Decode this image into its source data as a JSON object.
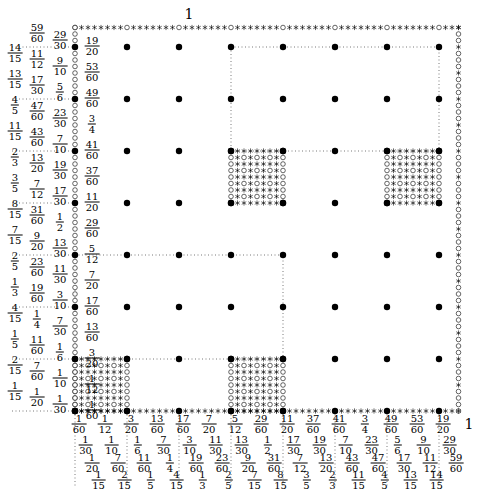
{
  "diagram": {
    "grid": {
      "denominator": 60,
      "filled_positions": [
        1,
        9,
        17,
        25,
        33,
        41,
        49,
        57
      ]
    },
    "corner_label": "1",
    "right_bottom_label": "1",
    "x_labels": [
      {
        "pos": 1,
        "text": "1/60",
        "row": 0
      },
      {
        "pos": 5,
        "text": "1/12",
        "row": 0
      },
      {
        "pos": 9,
        "text": "3/20",
        "row": 0
      },
      {
        "pos": 13,
        "text": "13/60",
        "row": 0
      },
      {
        "pos": 17,
        "text": "17/60",
        "row": 0
      },
      {
        "pos": 21,
        "text": "7/20",
        "row": 0
      },
      {
        "pos": 25,
        "text": "5/12",
        "row": 0
      },
      {
        "pos": 29,
        "text": "29/60",
        "row": 0
      },
      {
        "pos": 33,
        "text": "11/20",
        "row": 0
      },
      {
        "pos": 37,
        "text": "37/60",
        "row": 0
      },
      {
        "pos": 41,
        "text": "41/60",
        "row": 0
      },
      {
        "pos": 45,
        "text": "3/4",
        "row": 0
      },
      {
        "pos": 49,
        "text": "49/60",
        "row": 0
      },
      {
        "pos": 53,
        "text": "53/60",
        "row": 0
      },
      {
        "pos": 57,
        "text": "19/20",
        "row": 0
      },
      {
        "pos": 2,
        "text": "1/30",
        "row": 1
      },
      {
        "pos": 6,
        "text": "1/10",
        "row": 1
      },
      {
        "pos": 10,
        "text": "1/6",
        "row": 1
      },
      {
        "pos": 14,
        "text": "7/30",
        "row": 1
      },
      {
        "pos": 18,
        "text": "3/10",
        "row": 1
      },
      {
        "pos": 22,
        "text": "11/30",
        "row": 1
      },
      {
        "pos": 26,
        "text": "13/30",
        "row": 1
      },
      {
        "pos": 30,
        "text": "1/2",
        "row": 1
      },
      {
        "pos": 34,
        "text": "17/30",
        "row": 1
      },
      {
        "pos": 38,
        "text": "19/30",
        "row": 1
      },
      {
        "pos": 42,
        "text": "7/10",
        "row": 1
      },
      {
        "pos": 46,
        "text": "23/30",
        "row": 1
      },
      {
        "pos": 50,
        "text": "5/6",
        "row": 1
      },
      {
        "pos": 54,
        "text": "9/10",
        "row": 1
      },
      {
        "pos": 58,
        "text": "29/30",
        "row": 1
      },
      {
        "pos": 3,
        "text": "1/20",
        "row": 2
      },
      {
        "pos": 7,
        "text": "7/60",
        "row": 2
      },
      {
        "pos": 11,
        "text": "11/60",
        "row": 2
      },
      {
        "pos": 15,
        "text": "1/4",
        "row": 2
      },
      {
        "pos": 19,
        "text": "19/60",
        "row": 2
      },
      {
        "pos": 23,
        "text": "23/60",
        "row": 2
      },
      {
        "pos": 27,
        "text": "9/20",
        "row": 2
      },
      {
        "pos": 31,
        "text": "31/60",
        "row": 2
      },
      {
        "pos": 35,
        "text": "7/12",
        "row": 2
      },
      {
        "pos": 39,
        "text": "13/20",
        "row": 2
      },
      {
        "pos": 43,
        "text": "43/60",
        "row": 2
      },
      {
        "pos": 47,
        "text": "47/60",
        "row": 2
      },
      {
        "pos": 51,
        "text": "17/30",
        "row": 2
      },
      {
        "pos": 55,
        "text": "11/12",
        "row": 2
      },
      {
        "pos": 59,
        "text": "59/60",
        "row": 2
      },
      {
        "pos": 4,
        "text": "1/15",
        "row": 3
      },
      {
        "pos": 8,
        "text": "2/15",
        "row": 3
      },
      {
        "pos": 12,
        "text": "1/5",
        "row": 3
      },
      {
        "pos": 16,
        "text": "4/15",
        "row": 3
      },
      {
        "pos": 20,
        "text": "1/3",
        "row": 3
      },
      {
        "pos": 24,
        "text": "2/5",
        "row": 3
      },
      {
        "pos": 28,
        "text": "7/15",
        "row": 3
      },
      {
        "pos": 32,
        "text": "8/15",
        "row": 3
      },
      {
        "pos": 36,
        "text": "3/5",
        "row": 3
      },
      {
        "pos": 40,
        "text": "2/3",
        "row": 3
      },
      {
        "pos": 44,
        "text": "11/15",
        "row": 3
      },
      {
        "pos": 48,
        "text": "4/5",
        "row": 3
      },
      {
        "pos": 52,
        "text": "13/15",
        "row": 3
      },
      {
        "pos": 56,
        "text": "14/15",
        "row": 3
      }
    ],
    "y_labels": [
      {
        "pos": 57,
        "text": "19/20",
        "col": 0
      },
      {
        "pos": 53,
        "text": "53/60",
        "col": 0
      },
      {
        "pos": 49,
        "text": "49/60",
        "col": 0
      },
      {
        "pos": 45,
        "text": "3/4",
        "col": 0
      },
      {
        "pos": 41,
        "text": "41/60",
        "col": 0
      },
      {
        "pos": 37,
        "text": "37/60",
        "col": 0
      },
      {
        "pos": 33,
        "text": "11/20",
        "col": 0
      },
      {
        "pos": 29,
        "text": "29/60",
        "col": 0
      },
      {
        "pos": 25,
        "text": "5/12",
        "col": 0
      },
      {
        "pos": 21,
        "text": "7/20",
        "col": 0
      },
      {
        "pos": 17,
        "text": "17/60",
        "col": 0
      },
      {
        "pos": 13,
        "text": "13/60",
        "col": 0
      },
      {
        "pos": 9,
        "text": "3/20",
        "col": 0
      },
      {
        "pos": 5,
        "text": "1/12",
        "col": 0
      },
      {
        "pos": 1,
        "text": "1/60",
        "col": 0
      },
      {
        "pos": 58,
        "text": "29/30",
        "col": 1
      },
      {
        "pos": 54,
        "text": "9/10",
        "col": 1
      },
      {
        "pos": 50,
        "text": "5/6",
        "col": 1
      },
      {
        "pos": 46,
        "text": "23/30",
        "col": 1
      },
      {
        "pos": 42,
        "text": "7/10",
        "col": 1
      },
      {
        "pos": 38,
        "text": "19/30",
        "col": 1
      },
      {
        "pos": 34,
        "text": "17/30",
        "col": 1
      },
      {
        "pos": 30,
        "text": "1/2",
        "col": 1
      },
      {
        "pos": 26,
        "text": "13/30",
        "col": 1
      },
      {
        "pos": 22,
        "text": "11/30",
        "col": 1
      },
      {
        "pos": 18,
        "text": "3/10",
        "col": 1
      },
      {
        "pos": 14,
        "text": "7/30",
        "col": 1
      },
      {
        "pos": 10,
        "text": "1/6",
        "col": 1
      },
      {
        "pos": 6,
        "text": "1/10",
        "col": 1
      },
      {
        "pos": 2,
        "text": "1/30",
        "col": 1
      },
      {
        "pos": 59,
        "text": "59/60",
        "col": 2
      },
      {
        "pos": 55,
        "text": "11/12",
        "col": 2
      },
      {
        "pos": 51,
        "text": "17/30",
        "col": 2
      },
      {
        "pos": 47,
        "text": "47/60",
        "col": 2
      },
      {
        "pos": 43,
        "text": "43/60",
        "col": 2
      },
      {
        "pos": 39,
        "text": "13/20",
        "col": 2
      },
      {
        "pos": 35,
        "text": "7/12",
        "col": 2
      },
      {
        "pos": 31,
        "text": "31/60",
        "col": 2
      },
      {
        "pos": 27,
        "text": "9/20",
        "col": 2
      },
      {
        "pos": 23,
        "text": "23/60",
        "col": 2
      },
      {
        "pos": 19,
        "text": "19/60",
        "col": 2
      },
      {
        "pos": 15,
        "text": "1/4",
        "col": 2
      },
      {
        "pos": 11,
        "text": "11/60",
        "col": 2
      },
      {
        "pos": 7,
        "text": "7/60",
        "col": 2
      },
      {
        "pos": 3,
        "text": "1/20",
        "col": 2
      },
      {
        "pos": 56,
        "text": "14/15",
        "col": 3
      },
      {
        "pos": 52,
        "text": "13/15",
        "col": 3
      },
      {
        "pos": 48,
        "text": "4/5",
        "col": 3
      },
      {
        "pos": 44,
        "text": "11/15",
        "col": 3
      },
      {
        "pos": 40,
        "text": "2/3",
        "col": 3
      },
      {
        "pos": 36,
        "text": "3/5",
        "col": 3
      },
      {
        "pos": 32,
        "text": "8/15",
        "col": 3
      },
      {
        "pos": 28,
        "text": "7/15",
        "col": 3
      },
      {
        "pos": 24,
        "text": "2/5",
        "col": 3
      },
      {
        "pos": 20,
        "text": "1/3",
        "col": 3
      },
      {
        "pos": 16,
        "text": "4/15",
        "col": 3
      },
      {
        "pos": 12,
        "text": "1/5",
        "col": 3
      },
      {
        "pos": 8,
        "text": "2/15",
        "col": 3
      },
      {
        "pos": 4,
        "text": "1/15",
        "col": 3
      }
    ],
    "dense_blocks": [
      {
        "x": [
          1,
          9
        ],
        "y": [
          1,
          9
        ]
      },
      {
        "x": [
          25,
          33
        ],
        "y": [
          1,
          9
        ]
      },
      {
        "x": [
          25,
          33
        ],
        "y": [
          33,
          41
        ]
      },
      {
        "x": [
          49,
          57
        ],
        "y": [
          33,
          41
        ]
      }
    ],
    "dotted_rects": [
      {
        "x": [
          25,
          57
        ],
        "y": [
          41,
          57
        ]
      },
      {
        "x": [
          1,
          33
        ],
        "y": [
          9,
          25
        ]
      }
    ]
  }
}
